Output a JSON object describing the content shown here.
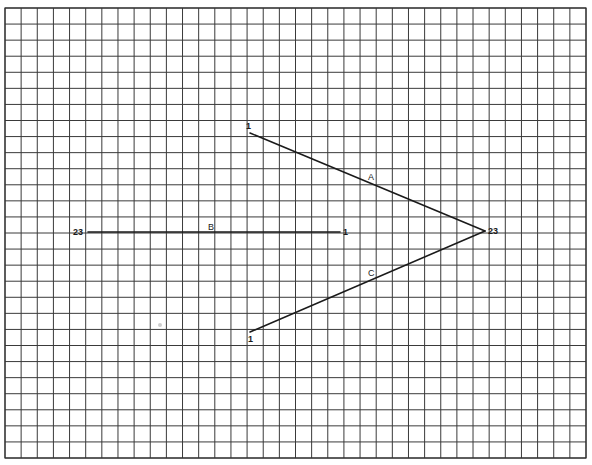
{
  "diagram": {
    "type": "graph-paper-line-segments",
    "colors": {
      "background": "#ffffff",
      "grid": "#3a3a3a",
      "segment": "#1a1a1a",
      "smudge": "#b8b8b8"
    },
    "grid": {
      "x0": 5,
      "y0": 8,
      "x1": 586,
      "y1": 458,
      "columns": 36,
      "rows": 28
    },
    "segments": [
      {
        "id": "A",
        "label": "A",
        "start": {
          "x": 250,
          "y": 133,
          "label": "1"
        },
        "end": {
          "x": 485,
          "y": 231,
          "label": "23"
        },
        "label_pos": {
          "x": 368,
          "y": 180
        },
        "start_label_pos": {
          "x": 246,
          "y": 129
        },
        "end_label_pos": null
      },
      {
        "id": "B",
        "label": "B",
        "start": {
          "x": 340,
          "y": 232,
          "label": "1"
        },
        "end": {
          "x": 88,
          "y": 232,
          "label": "23"
        },
        "label_pos": {
          "x": 208,
          "y": 230
        },
        "start_label_pos": {
          "x": 343,
          "y": 235
        },
        "end_label_pos": {
          "x": 73,
          "y": 235
        }
      },
      {
        "id": "C",
        "label": "C",
        "start": {
          "x": 250,
          "y": 332,
          "label": "1"
        },
        "end": {
          "x": 485,
          "y": 231,
          "label": "23"
        },
        "label_pos": {
          "x": 368,
          "y": 276
        },
        "start_label_pos": {
          "x": 248,
          "y": 342
        },
        "end_label_pos": null
      }
    ],
    "vertex_label": {
      "text": "23",
      "x": 488,
      "y": 234
    },
    "smudge": {
      "x": 160,
      "y": 325,
      "r": 2
    }
  }
}
